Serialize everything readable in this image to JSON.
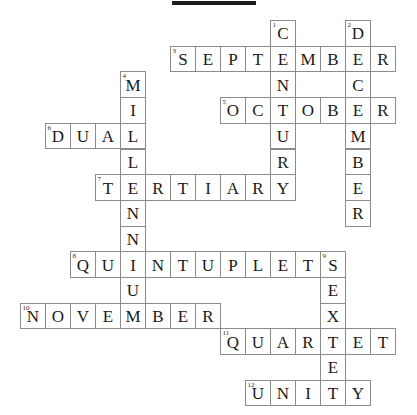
{
  "page": {
    "kind": "crossword-puzzle",
    "title_bar": "",
    "background_color": "#ffffff",
    "cell_border_color": "#8c8c8c",
    "letter_color": "#1a1a1a",
    "number_color": "#2b2b2b"
  },
  "grid": {
    "origin_x": 20,
    "origin_y": 20,
    "cell_w": 25,
    "cell_h": 25.7,
    "columns": 15,
    "rows": 15
  },
  "entries": [
    {
      "number": "1",
      "direction": "down",
      "answer": "CENTURY",
      "row": 0,
      "col": 10
    },
    {
      "number": "2",
      "direction": "down",
      "answer": "DECEMBER",
      "row": 0,
      "col": 13
    },
    {
      "number": "3",
      "direction": "across",
      "answer": "SEPTEMBER",
      "row": 1,
      "col": 6
    },
    {
      "number": "4",
      "direction": "down",
      "answer": "MILLENNIUM",
      "row": 2,
      "col": 4
    },
    {
      "number": "5",
      "direction": "across",
      "answer": "OCTOBER",
      "row": 3,
      "col": 8
    },
    {
      "number": "6",
      "direction": "across",
      "answer": "DUAL",
      "row": 4,
      "col": 1
    },
    {
      "number": "7",
      "direction": "across",
      "answer": "TERTIARY",
      "row": 6,
      "col": 3
    },
    {
      "number": "8",
      "direction": "across",
      "answer": "QUINTUPLETS",
      "row": 9,
      "col": 2
    },
    {
      "number": "9",
      "direction": "down",
      "answer": "SEXTET",
      "row": 9,
      "col": 12
    },
    {
      "number": "10",
      "direction": "across",
      "answer": "NOVEMBER",
      "row": 11,
      "col": 0
    },
    {
      "number": "11",
      "direction": "across",
      "answer": "QUARTET",
      "row": 12,
      "col": 8
    },
    {
      "number": "12",
      "direction": "across",
      "answer": "UNITY",
      "row": 14,
      "col": 9
    }
  ],
  "cells": [
    {
      "row": 0,
      "col": 10,
      "letter": "C",
      "number": "1"
    },
    {
      "row": 0,
      "col": 13,
      "letter": "D",
      "number": "2"
    },
    {
      "row": 1,
      "col": 6,
      "letter": "S",
      "number": "3"
    },
    {
      "row": 1,
      "col": 7,
      "letter": "E",
      "number": ""
    },
    {
      "row": 1,
      "col": 8,
      "letter": "P",
      "number": ""
    },
    {
      "row": 1,
      "col": 9,
      "letter": "T",
      "number": ""
    },
    {
      "row": 1,
      "col": 10,
      "letter": "E",
      "number": ""
    },
    {
      "row": 1,
      "col": 11,
      "letter": "M",
      "number": ""
    },
    {
      "row": 1,
      "col": 12,
      "letter": "B",
      "number": ""
    },
    {
      "row": 1,
      "col": 13,
      "letter": "E",
      "number": ""
    },
    {
      "row": 1,
      "col": 14,
      "letter": "R",
      "number": ""
    },
    {
      "row": 2,
      "col": 4,
      "letter": "M",
      "number": "4"
    },
    {
      "row": 2,
      "col": 10,
      "letter": "N",
      "number": ""
    },
    {
      "row": 2,
      "col": 13,
      "letter": "C",
      "number": ""
    },
    {
      "row": 3,
      "col": 4,
      "letter": "I",
      "number": ""
    },
    {
      "row": 3,
      "col": 8,
      "letter": "O",
      "number": "5"
    },
    {
      "row": 3,
      "col": 9,
      "letter": "C",
      "number": ""
    },
    {
      "row": 3,
      "col": 10,
      "letter": "T",
      "number": ""
    },
    {
      "row": 3,
      "col": 11,
      "letter": "O",
      "number": ""
    },
    {
      "row": 3,
      "col": 12,
      "letter": "B",
      "number": ""
    },
    {
      "row": 3,
      "col": 13,
      "letter": "E",
      "number": ""
    },
    {
      "row": 3,
      "col": 14,
      "letter": "R",
      "number": ""
    },
    {
      "row": 4,
      "col": 1,
      "letter": "D",
      "number": "6"
    },
    {
      "row": 4,
      "col": 2,
      "letter": "U",
      "number": ""
    },
    {
      "row": 4,
      "col": 3,
      "letter": "A",
      "number": ""
    },
    {
      "row": 4,
      "col": 4,
      "letter": "L",
      "number": ""
    },
    {
      "row": 4,
      "col": 10,
      "letter": "U",
      "number": ""
    },
    {
      "row": 4,
      "col": 13,
      "letter": "M",
      "number": ""
    },
    {
      "row": 5,
      "col": 4,
      "letter": "L",
      "number": ""
    },
    {
      "row": 5,
      "col": 10,
      "letter": "R",
      "number": ""
    },
    {
      "row": 5,
      "col": 13,
      "letter": "B",
      "number": ""
    },
    {
      "row": 6,
      "col": 3,
      "letter": "T",
      "number": "7"
    },
    {
      "row": 6,
      "col": 4,
      "letter": "E",
      "number": ""
    },
    {
      "row": 6,
      "col": 5,
      "letter": "R",
      "number": ""
    },
    {
      "row": 6,
      "col": 6,
      "letter": "T",
      "number": ""
    },
    {
      "row": 6,
      "col": 7,
      "letter": "I",
      "number": ""
    },
    {
      "row": 6,
      "col": 8,
      "letter": "A",
      "number": ""
    },
    {
      "row": 6,
      "col": 9,
      "letter": "R",
      "number": ""
    },
    {
      "row": 6,
      "col": 10,
      "letter": "Y",
      "number": ""
    },
    {
      "row": 6,
      "col": 13,
      "letter": "E",
      "number": ""
    },
    {
      "row": 7,
      "col": 4,
      "letter": "N",
      "number": ""
    },
    {
      "row": 7,
      "col": 13,
      "letter": "R",
      "number": ""
    },
    {
      "row": 8,
      "col": 4,
      "letter": "N",
      "number": ""
    },
    {
      "row": 9,
      "col": 2,
      "letter": "Q",
      "number": "8"
    },
    {
      "row": 9,
      "col": 3,
      "letter": "U",
      "number": ""
    },
    {
      "row": 9,
      "col": 4,
      "letter": "I",
      "number": ""
    },
    {
      "row": 9,
      "col": 5,
      "letter": "N",
      "number": ""
    },
    {
      "row": 9,
      "col": 6,
      "letter": "T",
      "number": ""
    },
    {
      "row": 9,
      "col": 7,
      "letter": "U",
      "number": ""
    },
    {
      "row": 9,
      "col": 8,
      "letter": "P",
      "number": ""
    },
    {
      "row": 9,
      "col": 9,
      "letter": "L",
      "number": ""
    },
    {
      "row": 9,
      "col": 10,
      "letter": "E",
      "number": ""
    },
    {
      "row": 9,
      "col": 11,
      "letter": "T",
      "number": ""
    },
    {
      "row": 9,
      "col": 12,
      "letter": "S",
      "number": "9"
    },
    {
      "row": 10,
      "col": 4,
      "letter": "U",
      "number": ""
    },
    {
      "row": 10,
      "col": 12,
      "letter": "E",
      "number": ""
    },
    {
      "row": 11,
      "col": 0,
      "letter": "N",
      "number": "10"
    },
    {
      "row": 11,
      "col": 1,
      "letter": "O",
      "number": ""
    },
    {
      "row": 11,
      "col": 2,
      "letter": "V",
      "number": ""
    },
    {
      "row": 11,
      "col": 3,
      "letter": "E",
      "number": ""
    },
    {
      "row": 11,
      "col": 4,
      "letter": "M",
      "number": ""
    },
    {
      "row": 11,
      "col": 5,
      "letter": "B",
      "number": ""
    },
    {
      "row": 11,
      "col": 6,
      "letter": "E",
      "number": ""
    },
    {
      "row": 11,
      "col": 7,
      "letter": "R",
      "number": ""
    },
    {
      "row": 11,
      "col": 12,
      "letter": "X",
      "number": ""
    },
    {
      "row": 12,
      "col": 8,
      "letter": "Q",
      "number": "11"
    },
    {
      "row": 12,
      "col": 9,
      "letter": "U",
      "number": ""
    },
    {
      "row": 12,
      "col": 10,
      "letter": "A",
      "number": ""
    },
    {
      "row": 12,
      "col": 11,
      "letter": "R",
      "number": ""
    },
    {
      "row": 12,
      "col": 12,
      "letter": "T",
      "number": ""
    },
    {
      "row": 12,
      "col": 13,
      "letter": "E",
      "number": ""
    },
    {
      "row": 12,
      "col": 14,
      "letter": "T",
      "number": ""
    },
    {
      "row": 13,
      "col": 12,
      "letter": "E",
      "number": ""
    },
    {
      "row": 14,
      "col": 9,
      "letter": "U",
      "number": "12"
    },
    {
      "row": 14,
      "col": 10,
      "letter": "N",
      "number": ""
    },
    {
      "row": 14,
      "col": 11,
      "letter": "I",
      "number": ""
    },
    {
      "row": 14,
      "col": 12,
      "letter": "T",
      "number": ""
    },
    {
      "row": 14,
      "col": 13,
      "letter": "Y",
      "number": ""
    }
  ]
}
